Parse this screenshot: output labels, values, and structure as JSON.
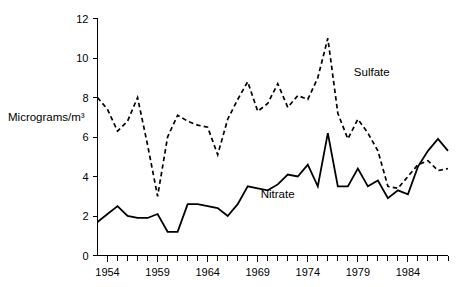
{
  "chart_data": {
    "type": "line",
    "title": "",
    "xlabel": "",
    "ylabel": "Micrograms/m³",
    "xlim": [
      1953,
      1988
    ],
    "ylim": [
      0,
      12
    ],
    "grid": false,
    "legend_position": "inline-annotations",
    "y_ticks": [
      0,
      2,
      4,
      6,
      8,
      10,
      12
    ],
    "y_tick_labels": [
      "0",
      "2",
      "4",
      "6",
      "8",
      "10",
      "12"
    ],
    "x_ticks": [
      1954,
      1955,
      1956,
      1957,
      1958,
      1959,
      1960,
      1961,
      1962,
      1963,
      1964,
      1965,
      1966,
      1967,
      1968,
      1969,
      1970,
      1971,
      1972,
      1973,
      1974,
      1975,
      1976,
      1977,
      1978,
      1979,
      1980,
      1981,
      1982,
      1983,
      1984,
      1985,
      1986,
      1987,
      1988
    ],
    "x_tick_labels": [
      "1954",
      "1959",
      "1964",
      "1969",
      "1974",
      "1979",
      "1984"
    ],
    "x_labeled_ticks": [
      1954,
      1959,
      1964,
      1969,
      1974,
      1979,
      1984
    ],
    "x": [
      1953,
      1954,
      1955,
      1956,
      1957,
      1958,
      1959,
      1960,
      1961,
      1962,
      1963,
      1964,
      1965,
      1966,
      1967,
      1968,
      1969,
      1970,
      1971,
      1972,
      1973,
      1974,
      1975,
      1976,
      1977,
      1978,
      1979,
      1980,
      1981,
      1982,
      1983,
      1984,
      1985,
      1986,
      1987,
      1988
    ],
    "series": [
      {
        "name": "Sulfate",
        "style": "dashed",
        "label_x": 1978.6,
        "label_y": 9.3,
        "values": [
          8.0,
          7.4,
          6.3,
          6.8,
          8.0,
          5.6,
          3.0,
          6.0,
          7.1,
          6.8,
          6.6,
          6.5,
          5.1,
          6.9,
          7.9,
          8.8,
          7.3,
          7.7,
          8.7,
          7.5,
          8.1,
          7.9,
          9.0,
          11.0,
          7.2,
          5.9,
          6.9,
          6.2,
          5.3,
          3.5,
          3.4,
          4.0,
          4.6,
          4.8,
          4.3,
          4.4
        ]
      },
      {
        "name": "Nitrate",
        "style": "solid",
        "label_x": 1969.3,
        "label_y": 3.1,
        "values": [
          1.7,
          2.1,
          2.5,
          2.0,
          1.9,
          1.9,
          2.1,
          1.2,
          1.2,
          2.6,
          2.6,
          2.5,
          2.4,
          2.0,
          2.6,
          3.5,
          3.4,
          3.3,
          3.6,
          4.1,
          4.0,
          4.6,
          3.5,
          6.2,
          3.5,
          3.5,
          4.4,
          3.5,
          3.8,
          2.9,
          3.3,
          3.1,
          4.5,
          5.3,
          5.9,
          5.3
        ]
      }
    ]
  },
  "annotations": {
    "sulfate_label": "Sulfate",
    "nitrate_label": "Nitrate"
  }
}
